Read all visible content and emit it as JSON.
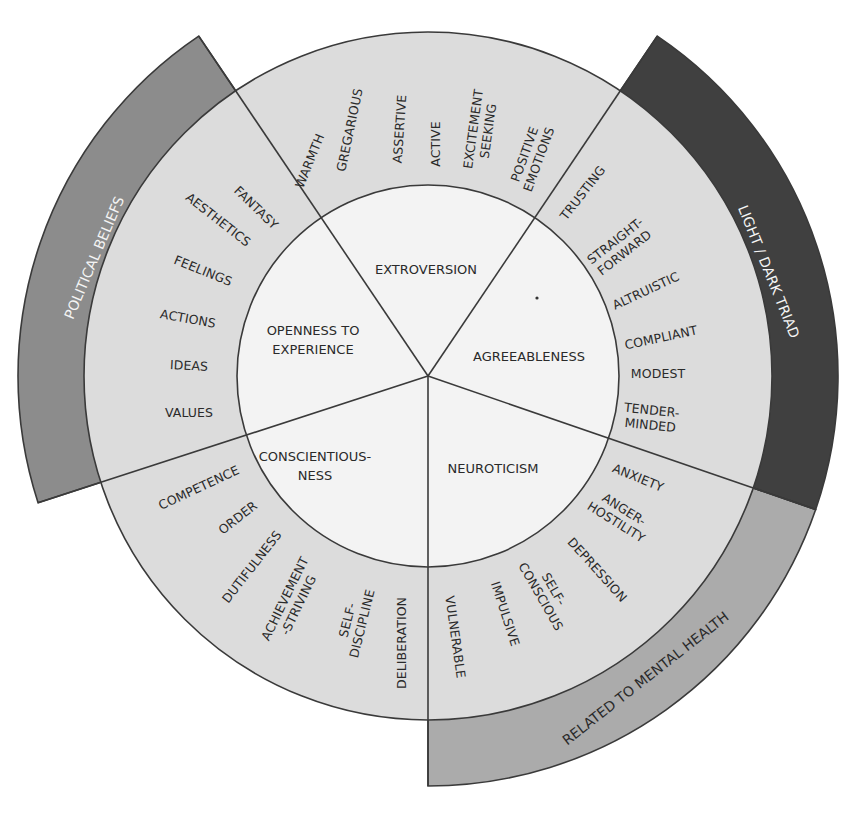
{
  "diagram": {
    "center": [
      428,
      376
    ],
    "radii": {
      "inner": 191,
      "ring": 344,
      "band": 410
    },
    "colors": {
      "inner": "#f3f3f3",
      "ring": "#dcdcdc",
      "line": "#3a3a3a",
      "text": "#2a2a2a",
      "political_band": "#8c8c8c",
      "dark_triad_band": "#404040",
      "mental_health_band": "#ababab"
    },
    "dividers_deg": [
      -124,
      -56,
      19,
      90,
      162
    ],
    "domains": [
      {
        "id": "extroversion",
        "lines": [
          "EXTROVERSION"
        ],
        "x": 426,
        "y": 270
      },
      {
        "id": "agreeableness",
        "lines": [
          "AGREEABLENESS"
        ],
        "x": 529,
        "y": 357
      },
      {
        "id": "neuroticism",
        "lines": [
          "NEUROTICISM"
        ],
        "x": 493,
        "y": 469
      },
      {
        "id": "conscientiousness",
        "lines": [
          "CONSCIENTIOUS-",
          "NESS"
        ],
        "x": 315,
        "y": 466
      },
      {
        "id": "openness",
        "lines": [
          "OPENNESS TO",
          "EXPERIENCE"
        ],
        "x": 313,
        "y": 340
      }
    ],
    "facets": [
      {
        "group": "openness",
        "lines": [
          "FANTASY"
        ],
        "x": 256,
        "y": 208,
        "rot": 44
      },
      {
        "group": "openness",
        "lines": [
          "AESTHETICS"
        ],
        "x": 218,
        "y": 220,
        "rot": 38
      },
      {
        "group": "openness",
        "lines": [
          "FEELINGS"
        ],
        "x": 203,
        "y": 271,
        "rot": 22
      },
      {
        "group": "openness",
        "lines": [
          "ACTIONS"
        ],
        "x": 188,
        "y": 319,
        "rot": 10
      },
      {
        "group": "openness",
        "lines": [
          "IDEAS"
        ],
        "x": 189,
        "y": 366,
        "rot": 3
      },
      {
        "group": "openness",
        "lines": [
          "VALUES"
        ],
        "x": 189,
        "y": 413,
        "rot": 0
      },
      {
        "group": "extroversion",
        "lines": [
          "WARMTH"
        ],
        "x": 310,
        "y": 161,
        "rot": -68
      },
      {
        "group": "extroversion",
        "lines": [
          "GREGARIOUS"
        ],
        "x": 350,
        "y": 130,
        "rot": -78
      },
      {
        "group": "extroversion",
        "lines": [
          "ASSERTIVE"
        ],
        "x": 400,
        "y": 129,
        "rot": -86
      },
      {
        "group": "extroversion",
        "lines": [
          "ACTIVE"
        ],
        "x": 436,
        "y": 144,
        "rot": -90
      },
      {
        "group": "extroversion",
        "lines": [
          "EXCITEMENT",
          "SEEKING"
        ],
        "x": 481,
        "y": 130,
        "rot": -82
      },
      {
        "group": "extroversion",
        "lines": [
          "POSITIVE",
          "EMOTIONS"
        ],
        "x": 532,
        "y": 157,
        "rot": -70
      },
      {
        "group": "agreeableness",
        "lines": [
          "TRUSTING"
        ],
        "x": 583,
        "y": 193,
        "rot": -52
      },
      {
        "group": "agreeableness",
        "lines": [
          "STRAIGHT-",
          "FORWARD"
        ],
        "x": 620,
        "y": 247,
        "rot": -38
      },
      {
        "group": "agreeableness",
        "lines": [
          "ALTRUISTIC"
        ],
        "x": 646,
        "y": 291,
        "rot": -25
      },
      {
        "group": "agreeableness",
        "lines": [
          "COMPLIANT"
        ],
        "x": 661,
        "y": 338,
        "rot": -12
      },
      {
        "group": "agreeableness",
        "lines": [
          "MODEST"
        ],
        "x": 658,
        "y": 374,
        "rot": 0
      },
      {
        "group": "agreeableness",
        "lines": [
          "TENDER-",
          "MINDED"
        ],
        "x": 651,
        "y": 418,
        "rot": 6
      },
      {
        "group": "neuroticism",
        "lines": [
          "ANXIETY"
        ],
        "x": 638,
        "y": 478,
        "rot": 22
      },
      {
        "group": "neuroticism",
        "lines": [
          "ANGER-",
          "HOSTILITY"
        ],
        "x": 620,
        "y": 516,
        "rot": 32
      },
      {
        "group": "neuroticism",
        "lines": [
          "DEPRESSION"
        ],
        "x": 597,
        "y": 570,
        "rot": 48
      },
      {
        "group": "neuroticism",
        "lines": [
          "SELF-",
          "CONSCIOUS"
        ],
        "x": 547,
        "y": 593,
        "rot": 60
      },
      {
        "group": "neuroticism",
        "lines": [
          "IMPULSIVE"
        ],
        "x": 505,
        "y": 614,
        "rot": 72
      },
      {
        "group": "neuroticism",
        "lines": [
          "VULNERABLE"
        ],
        "x": 455,
        "y": 637,
        "rot": 82
      },
      {
        "group": "conscientiousness",
        "lines": [
          "COMPETENCE"
        ],
        "x": 199,
        "y": 488,
        "rot": -25
      },
      {
        "group": "conscientiousness",
        "lines": [
          "ORDER"
        ],
        "x": 238,
        "y": 518,
        "rot": -38
      },
      {
        "group": "conscientiousness",
        "lines": [
          "DUTIFULNESS"
        ],
        "x": 252,
        "y": 567,
        "rot": -52
      },
      {
        "group": "conscientiousness",
        "lines": [
          "ACHIEVEMENT",
          "-STRIVING"
        ],
        "x": 292,
        "y": 602,
        "rot": -64
      },
      {
        "group": "conscientiousness",
        "lines": [
          "SELF-",
          "DISCIPLINE"
        ],
        "x": 355,
        "y": 622,
        "rot": -76
      },
      {
        "group": "conscientiousness",
        "lines": [
          "DELIBERATION"
        ],
        "x": 402,
        "y": 643,
        "rot": -90
      }
    ],
    "bands": [
      {
        "id": "political-beliefs",
        "label": "POLITICAL BELIEFS",
        "start_deg": -124,
        "end_deg": 162,
        "sweep": "ccw",
        "fill_key": "political_band",
        "text_color": "#f4f4f4",
        "label_x": 95,
        "label_y": 258,
        "label_rot": -67
      },
      {
        "id": "light-dark-triad",
        "label": "LIGHT / DARK TRIAD",
        "start_deg": -56,
        "end_deg": 19,
        "sweep": "cw",
        "fill_key": "dark_triad_band",
        "text_color": "#f4f4f4",
        "label_x": 768,
        "label_y": 272,
        "label_rot": 68
      },
      {
        "id": "related-to-mental-health",
        "label": "RELATED TO MENTAL HEALTH",
        "start_deg": 19,
        "end_deg": 90,
        "sweep": "cw",
        "fill_key": "mental_health_band",
        "text_color": "#2a2a2a",
        "label_x": 646,
        "label_y": 679,
        "label_rot": -38
      }
    ],
    "dot": [
      537,
      298
    ]
  }
}
